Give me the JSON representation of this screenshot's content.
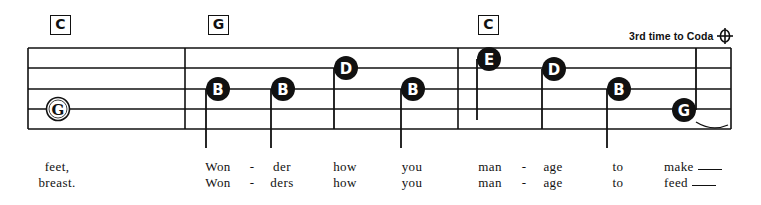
{
  "sheet": {
    "title": "Tablature-style lead sheet excerpt",
    "coda_instruction": "3rd time to Coda",
    "coda_symbol": "coda-icon",
    "chords": [
      {
        "label": "C",
        "x": 50
      },
      {
        "label": "G",
        "x": 208
      },
      {
        "label": "C",
        "x": 478
      }
    ],
    "staff": {
      "left": 28,
      "right": 731,
      "lines_y": [
        48,
        68,
        89,
        109,
        129
      ],
      "barlines_x": [
        185,
        458,
        731
      ]
    },
    "notes": [
      {
        "letter": "G",
        "x": 58,
        "y": 109,
        "style": "open",
        "stem": false
      },
      {
        "letter": "B",
        "x": 218,
        "y": 89,
        "style": "filled",
        "stem": true,
        "stem_x": 206,
        "stem_bottom": 148
      },
      {
        "letter": "B",
        "x": 283,
        "y": 89,
        "style": "filled",
        "stem": true,
        "stem_x": 271,
        "stem_bottom": 148
      },
      {
        "letter": "D",
        "x": 346,
        "y": 68,
        "style": "filled",
        "stem": true,
        "stem_x": 334,
        "stem_bottom": 129
      },
      {
        "letter": "B",
        "x": 413,
        "y": 89,
        "style": "filled",
        "stem": true,
        "stem_x": 401,
        "stem_bottom": 148
      },
      {
        "letter": "E",
        "x": 489,
        "y": 59,
        "style": "filled",
        "stem": true,
        "stem_x": 477,
        "stem_bottom": 120
      },
      {
        "letter": "D",
        "x": 554,
        "y": 69,
        "style": "filled",
        "stem": true,
        "stem_x": 542,
        "stem_bottom": 129
      },
      {
        "letter": "B",
        "x": 619,
        "y": 89,
        "style": "filled",
        "stem": true,
        "stem_x": 607,
        "stem_bottom": 148
      },
      {
        "letter": "G",
        "x": 684,
        "y": 110,
        "style": "filled",
        "stem": true,
        "stem_x": 696,
        "stem_top": 48,
        "stem_up": true,
        "tie": true
      }
    ]
  },
  "lyrics": {
    "verse_1": [
      {
        "text": "feet,",
        "x": 57
      },
      {
        "text": "Won",
        "x": 218
      },
      {
        "text": "-",
        "x": 252
      },
      {
        "text": "der",
        "x": 282
      },
      {
        "text": "how",
        "x": 345
      },
      {
        "text": "you",
        "x": 412
      },
      {
        "text": "man",
        "x": 490
      },
      {
        "text": "-",
        "x": 524
      },
      {
        "text": "age",
        "x": 553
      },
      {
        "text": "to",
        "x": 618
      },
      {
        "text": "make",
        "x": 686,
        "extender": true
      }
    ],
    "verse_2": [
      {
        "text": "breast.",
        "x": 57
      },
      {
        "text": "Won",
        "x": 218
      },
      {
        "text": "-",
        "x": 252
      },
      {
        "text": "ders",
        "x": 282
      },
      {
        "text": "how",
        "x": 345
      },
      {
        "text": "you",
        "x": 412
      },
      {
        "text": "man",
        "x": 490
      },
      {
        "text": "-",
        "x": 524
      },
      {
        "text": "age",
        "x": 553
      },
      {
        "text": "to",
        "x": 618
      },
      {
        "text": "feed",
        "x": 686,
        "extender": true
      }
    ]
  },
  "colors": {
    "ink": "#111111",
    "paper": "#ffffff"
  }
}
